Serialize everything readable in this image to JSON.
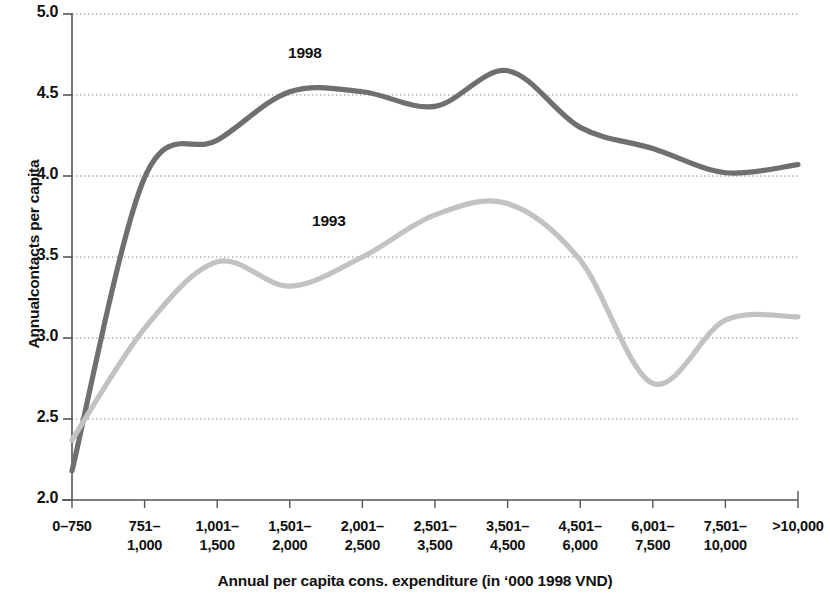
{
  "chart_data": {
    "type": "line",
    "title": "",
    "xlabel": "Annual per capita cons. expenditure (in ‘000 1998 VND)",
    "ylabel": "Annualcontacts per capita",
    "ylim": [
      2.0,
      5.0
    ],
    "yticks": [
      "2.0",
      "2.5",
      "3.0",
      "3.5",
      "4.0",
      "4.5",
      "5.0"
    ],
    "ytick_values": [
      2.0,
      2.5,
      3.0,
      3.5,
      4.0,
      4.5,
      5.0
    ],
    "grid": "horizontal-dotted",
    "legend_position": "inline-annotation",
    "categories": [
      "0–750",
      "751–1,000",
      "1,001–1,500",
      "1,501–2,000",
      "2,001–2,500",
      "2,501–3,500",
      "3,501–4,500",
      "4,501–6,000",
      "6,001–7,500",
      "7,501–10,000",
      ">10,000"
    ],
    "category_lines": [
      [
        "0–750",
        ""
      ],
      [
        "751–",
        "1,000"
      ],
      [
        "1,001–",
        "1,500"
      ],
      [
        "1,501–",
        "2,000"
      ],
      [
        "2,001–",
        "2,500"
      ],
      [
        "2,501–",
        "3,500"
      ],
      [
        "3,501–",
        "4,500"
      ],
      [
        "4,501–",
        "6,000"
      ],
      [
        "6,001–",
        "7,500"
      ],
      [
        "7,501–",
        "10,000"
      ],
      [
        ">10,000",
        ""
      ]
    ],
    "series": [
      {
        "name": "1998",
        "color": "#6f6f6f",
        "label_x_category": "1,501–2,000",
        "values": [
          2.18,
          3.99,
          4.22,
          4.52,
          4.52,
          4.43,
          4.65,
          4.3,
          4.17,
          4.02,
          4.07
        ]
      },
      {
        "name": "1993",
        "color": "#c2c2c2",
        "label_x_category": "2,001–2,500",
        "values": [
          2.37,
          3.06,
          3.47,
          3.32,
          3.5,
          3.76,
          3.83,
          3.48,
          2.72,
          3.11,
          3.13
        ]
      }
    ],
    "axis_color": "#555555",
    "grid_color": "#888888",
    "background": "#ffffff"
  }
}
